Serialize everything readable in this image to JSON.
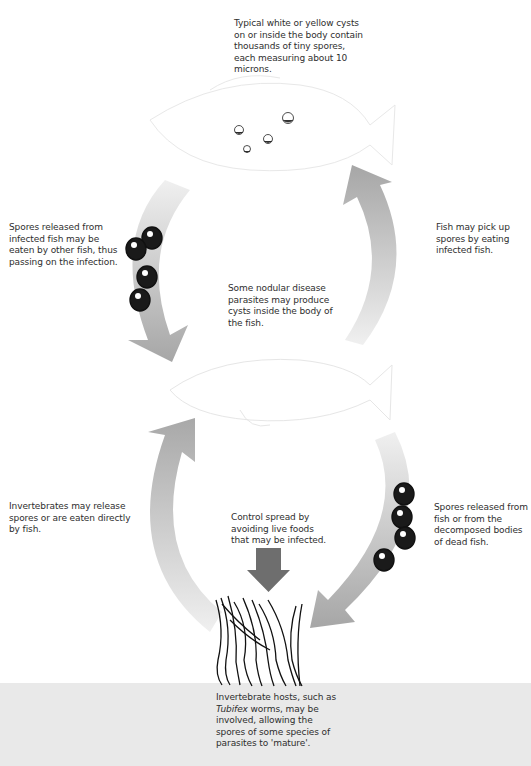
{
  "diagram": {
    "labels": {
      "top_cysts": "Typical white or yellow cysts on or inside the body contain thousands of tiny spores, each measuring about 10 microns.",
      "left_upper": "Spores released from infected fish may be eaten by other fish, thus passing on the infection.",
      "right_upper": "Fish may pick up spores by eating infected fish.",
      "center_middle": "Some nodular disease parasites may produce cysts inside the body of the fish.",
      "left_lower": "Invertebrates may release spores or are eaten directly by fish.",
      "center_lower": "Control spread by avoiding live foods that may be infected.",
      "right_lower": "Spores released from fish or from the decomposed bodies of dead fish.",
      "bottom_prefix": "Invertebrate hosts, such as ",
      "bottom_italic": "Tubifex",
      "bottom_suffix": " worms, may be involved, allowing the spores of some species of parasites to 'mature'."
    },
    "colors": {
      "arrow_dark": "#a8a8a8",
      "arrow_light": "#ececec",
      "down_arrow": "#6e6e6e",
      "ground": "#e9e9e9",
      "spore": "#1a1a1a"
    }
  }
}
